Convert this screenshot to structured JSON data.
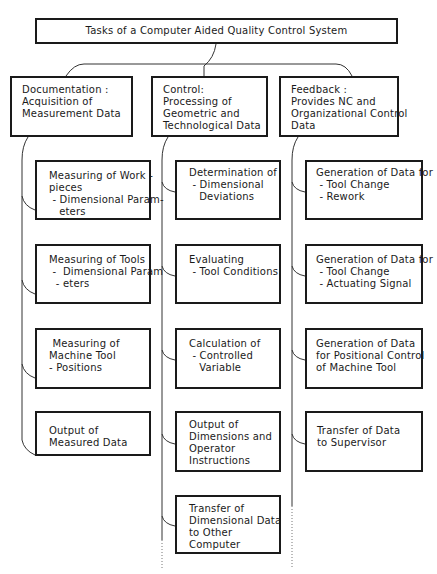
{
  "diagram": {
    "title": "Tasks of a Computer Aided Quality Control System",
    "branches": [
      {
        "id": "documentation",
        "heading": [
          "Documentation :",
          "Acquisition of",
          "Measurement Data"
        ],
        "children": [
          {
            "lines": [
              "Measuring of Work -",
              "pieces",
              " - Dimensional Param-",
              "   eters"
            ]
          },
          {
            "lines": [
              "Measuring of Tools",
              " -  Dimensional Param",
              "  - eters"
            ]
          },
          {
            "lines": [
              " Measuring of",
              "Machine Tool",
              "- Positions"
            ]
          },
          {
            "lines": [
              "Output of",
              "Measured Data"
            ]
          }
        ]
      },
      {
        "id": "control",
        "heading": [
          "Control:",
          "Processing of",
          "Geometric and",
          "Technological Data"
        ],
        "children": [
          {
            "lines": [
              "Determination of",
              " - Dimensional",
              "   Deviations"
            ]
          },
          {
            "lines": [
              "Evaluating",
              " - Tool Conditions"
            ]
          },
          {
            "lines": [
              "Calculation of",
              " - Controlled",
              "   Variable"
            ]
          },
          {
            "lines": [
              "Output of",
              "Dimensions and",
              "Operator",
              "Instructions"
            ]
          },
          {
            "lines": [
              "Transfer of",
              "Dimensional Data",
              "to Other",
              "Computer"
            ]
          }
        ]
      },
      {
        "id": "feedback",
        "heading": [
          "Feedback :",
          "Provides NC and",
          "Organizational Control",
          "Data"
        ],
        "children": [
          {
            "lines": [
              "Generation of Data for",
              " - Tool Change",
              " - Rework"
            ]
          },
          {
            "lines": [
              "Generation of Data for",
              " - Tool Change",
              " - Actuating Signal"
            ]
          },
          {
            "lines": [
              "Generation of Data",
              "for Positional Control",
              "of Machine Tool"
            ]
          },
          {
            "lines": [
              "Transfer of Data",
              "to Supervisor"
            ]
          }
        ]
      }
    ]
  },
  "colors": {
    "line": "#1a1a1a",
    "background": "#ffffff"
  }
}
